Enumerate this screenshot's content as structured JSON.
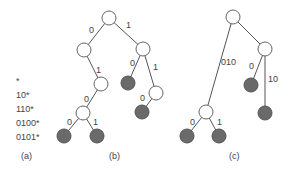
{
  "panel_a": {
    "prefixes": [
      "*",
      "10*",
      "110*",
      "0100*",
      "0101*"
    ],
    "caption": "(a)"
  },
  "panel_b": {
    "caption": "(b)",
    "edge_labels": [
      "0",
      "1",
      "1",
      "0",
      "0",
      "1",
      "0",
      "1",
      "0"
    ]
  },
  "panel_c": {
    "caption": "(c)",
    "edge_labels": [
      "010",
      "0",
      "10",
      "0",
      "1"
    ]
  },
  "colors": {
    "leaf": "#6a6a6a",
    "internal": "#ffffff",
    "stroke": "#555555"
  }
}
